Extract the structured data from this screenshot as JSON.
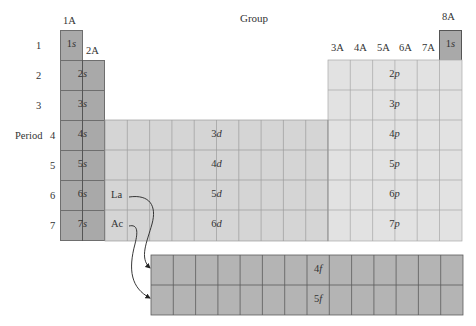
{
  "title": "Group",
  "period_axis_label": "Period",
  "group_labels": [
    {
      "id": "1A",
      "label": "1A"
    },
    {
      "id": "2A",
      "label": "2A"
    },
    {
      "id": "3A",
      "label": "3A"
    },
    {
      "id": "4A",
      "label": "4A"
    },
    {
      "id": "5A",
      "label": "5A"
    },
    {
      "id": "6A",
      "label": "6A"
    },
    {
      "id": "7A",
      "label": "7A"
    },
    {
      "id": "8A",
      "label": "8A"
    }
  ],
  "period_numbers": [
    "1",
    "2",
    "3",
    "4",
    "5",
    "6",
    "7"
  ],
  "s_block": {
    "color": "#a9a9a9",
    "labels": [
      {
        "num": "1",
        "sub": "s"
      },
      {
        "num": "2",
        "sub": "s"
      },
      {
        "num": "3",
        "sub": "s"
      },
      {
        "num": "4",
        "sub": "s"
      },
      {
        "num": "5",
        "sub": "s"
      },
      {
        "num": "6",
        "sub": "s"
      },
      {
        "num": "7",
        "sub": "s"
      }
    ],
    "helium": {
      "num": "1",
      "sub": "s"
    }
  },
  "d_block": {
    "color": "#d5d5d5",
    "labels": [
      {
        "num": "3",
        "sub": "d"
      },
      {
        "num": "4",
        "sub": "d"
      },
      {
        "num": "5",
        "sub": "d"
      },
      {
        "num": "6",
        "sub": "d"
      }
    ],
    "elements": [
      "La",
      "Ac"
    ]
  },
  "p_block": {
    "color": "#e2e2e2",
    "labels": [
      {
        "num": "2",
        "sub": "p"
      },
      {
        "num": "3",
        "sub": "p"
      },
      {
        "num": "4",
        "sub": "p"
      },
      {
        "num": "5",
        "sub": "p"
      },
      {
        "num": "6",
        "sub": "p"
      },
      {
        "num": "7",
        "sub": "p"
      }
    ]
  },
  "f_block": {
    "color": "#b4b4b4",
    "labels": [
      {
        "num": "4",
        "sub": "f"
      },
      {
        "num": "5",
        "sub": "f"
      }
    ]
  }
}
